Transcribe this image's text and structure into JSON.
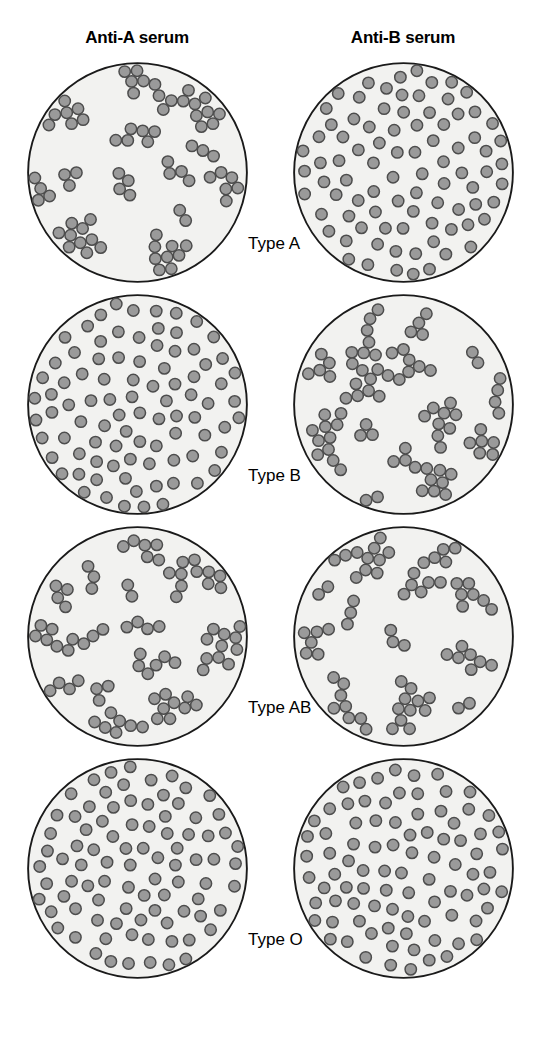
{
  "figure": {
    "columns": [
      {
        "id": "anti-a",
        "label": "Anti-A serum"
      },
      {
        "id": "anti-b",
        "label": "Anti-B serum"
      }
    ],
    "rows": [
      {
        "id": "type-a",
        "label": "Type A",
        "anti_a_reaction": "agglutinated",
        "anti_b_reaction": "not-agglutinated"
      },
      {
        "id": "type-b",
        "label": "Type B",
        "anti_a_reaction": "not-agglutinated",
        "anti_b_reaction": "agglutinated"
      },
      {
        "id": "type-ab",
        "label": "Type AB",
        "anti_a_reaction": "agglutinated",
        "anti_b_reaction": "agglutinated"
      },
      {
        "id": "type-o",
        "label": "Type O",
        "anti_a_reaction": "not-agglutinated",
        "anti_b_reaction": "not-agglutinated"
      }
    ],
    "colors": {
      "dish_fill": "#f2f2f0",
      "dish_outline": "#1a1a1a",
      "cell_fill": "#9a9a9a",
      "cell_outline": "#4d4d4d",
      "background": "#ffffff",
      "text": "#000000"
    },
    "geometry": {
      "dish_diameter_px": 221,
      "cell_diameter_px": 13,
      "dispersed_cell_count": 88,
      "agglutinated_cell_count": 96
    }
  },
  "chart_data": {
    "type": "table",
    "columns": [
      "Blood type",
      "Anti-A serum",
      "Anti-B serum"
    ],
    "rows": [
      [
        "Type A",
        "agglutinated",
        "not-agglutinated"
      ],
      [
        "Type B",
        "not-agglutinated",
        "agglutinated"
      ],
      [
        "Type AB",
        "agglutinated",
        "agglutinated"
      ],
      [
        "Type O",
        "not-agglutinated",
        "not-agglutinated"
      ]
    ],
    "legend": [
      "agglutinated = clumped red blood cells",
      "not-agglutinated = evenly dispersed red blood cells"
    ],
    "xlabel": "Antiserum",
    "ylabel": "Blood type"
  }
}
